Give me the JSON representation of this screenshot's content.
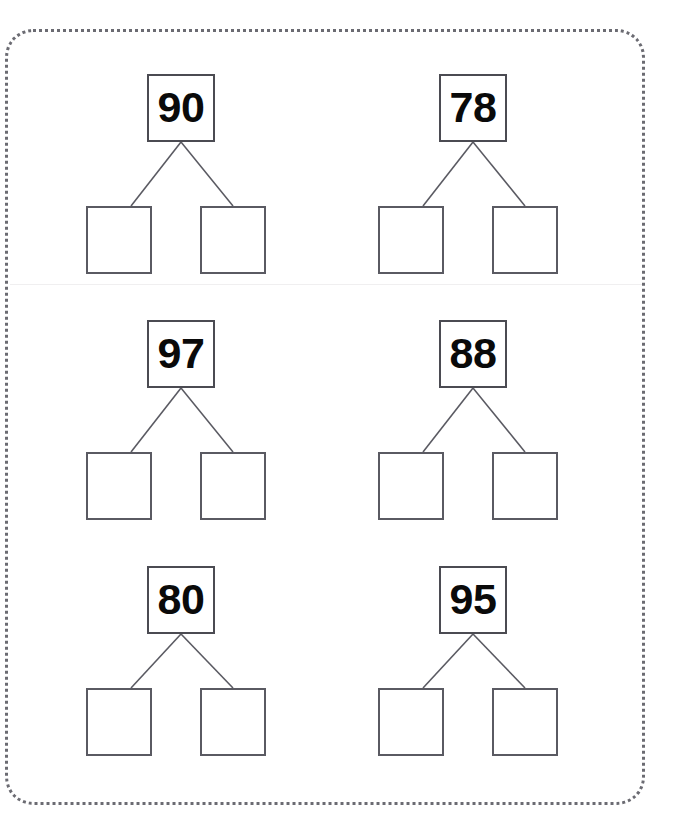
{
  "worksheet": {
    "title": "Number Bonds Worksheet",
    "frame_style": "dotted-rounded-border",
    "frame_color": "#6b6b72",
    "background_color": "#ffffff",
    "box_border_color": "#4b4b52",
    "number_color": "#0a0a0a",
    "divider_color": "#f0eff0"
  },
  "problems": [
    {
      "id": "problem-1",
      "position": "row1-left",
      "whole": "90",
      "part_left": "",
      "part_right": "",
      "part_left_placeholder": "",
      "part_right_placeholder": ""
    },
    {
      "id": "problem-2",
      "position": "row1-right",
      "whole": "78",
      "part_left": "",
      "part_right": "",
      "part_left_placeholder": "",
      "part_right_placeholder": ""
    },
    {
      "id": "problem-3",
      "position": "row2-left",
      "whole": "97",
      "part_left": "",
      "part_right": "",
      "part_left_placeholder": "",
      "part_right_placeholder": ""
    },
    {
      "id": "problem-4",
      "position": "row2-right",
      "whole": "88",
      "part_left": "",
      "part_right": "",
      "part_left_placeholder": "",
      "part_right_placeholder": ""
    },
    {
      "id": "problem-5",
      "position": "row3-left",
      "whole": "80",
      "part_left": "",
      "part_right": "",
      "part_left_placeholder": "",
      "part_right_placeholder": ""
    },
    {
      "id": "problem-6",
      "position": "row3-right",
      "whole": "95",
      "part_left": "",
      "part_right": "",
      "part_left_placeholder": "",
      "part_right_placeholder": ""
    }
  ],
  "layout": {
    "columns": 2,
    "rows": 3,
    "column_x": [
      86,
      378
    ],
    "row_y": [
      74,
      320,
      566
    ]
  }
}
